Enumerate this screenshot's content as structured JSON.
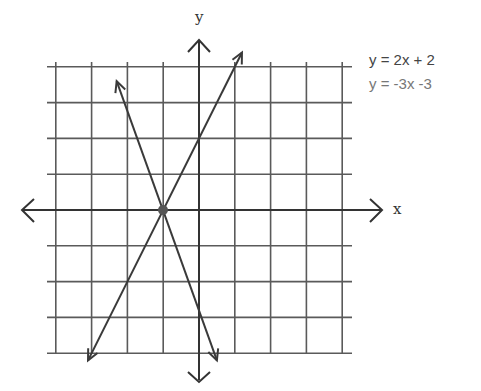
{
  "chart_data": {
    "type": "line",
    "title": "",
    "xlabel": "x",
    "ylabel": "y",
    "xlim": [
      -4,
      4
    ],
    "ylim": [
      -4,
      4
    ],
    "grid": true,
    "tick_labels": false,
    "legend_position": "top-right",
    "legend": [
      "y = 2x + 2",
      "y = -3x -3"
    ],
    "series": [
      {
        "name": "y = 2x + 2",
        "slope": 2,
        "intercept": 2,
        "x": [
          -3.1,
          1.2
        ],
        "y": [
          -4.2,
          4.4
        ]
      },
      {
        "name": "y = -3x -3",
        "slope": -3,
        "intercept": -3,
        "x": [
          -2.3,
          0.5
        ],
        "y": [
          3.6,
          -4.2
        ]
      }
    ],
    "annotations": [
      {
        "type": "point",
        "label": "intersection",
        "x": -1,
        "y": 0
      }
    ]
  },
  "legend": {
    "eq1": "y = 2x + 2",
    "eq2": "y = -3x -3"
  },
  "axes": {
    "x_label": "x",
    "y_label": "y"
  },
  "style": {
    "grid_color": "#444444",
    "line_color": "#333333",
    "text_color": "#555555"
  }
}
